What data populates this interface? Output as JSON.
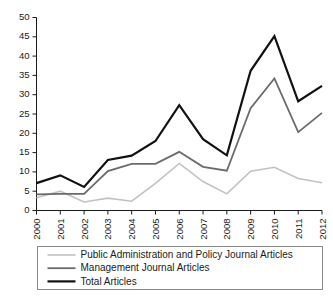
{
  "chart_data": {
    "type": "line",
    "title": "",
    "xlabel": "",
    "ylabel": "",
    "x": [
      "2000",
      "2001",
      "2002",
      "2003",
      "2004",
      "2005",
      "2006",
      "2007",
      "2008",
      "2009",
      "2010",
      "2011",
      "2012"
    ],
    "categories": [
      "2000",
      "2001",
      "2002",
      "2003",
      "2004",
      "2005",
      "2006",
      "2007",
      "2008",
      "2009",
      "2010",
      "2011",
      "2012"
    ],
    "ylim": [
      0,
      50
    ],
    "yticks": [
      0,
      5,
      10,
      15,
      20,
      25,
      30,
      35,
      40,
      45,
      50
    ],
    "ytick_labels": [
      "0",
      "5",
      "10",
      "15",
      "20",
      "25",
      "30",
      "35",
      "40",
      "45",
      "50"
    ],
    "grid": false,
    "legend_position": "below",
    "series": [
      {
        "name": "Public Administration and Policy Journal Articles",
        "color": "#c2c2c2",
        "width": 1.6,
        "values": [
          3.3,
          5.0,
          2.2,
          3.2,
          2.4,
          7.0,
          12.2,
          7.5,
          4.3,
          10.2,
          11.2,
          8.3,
          7.2
        ]
      },
      {
        "name": "Management Journal Articles",
        "color": "#6b6b6b",
        "width": 1.8,
        "values": [
          4.2,
          4.3,
          4.3,
          10.2,
          12.1,
          12.1,
          15.2,
          11.3,
          10.3,
          26.5,
          34.2,
          20.3,
          25.3
        ]
      },
      {
        "name": "Total Articles",
        "color": "#111111",
        "width": 2.2,
        "values": [
          7.1,
          9.1,
          6.1,
          13.1,
          14.2,
          18.0,
          27.3,
          18.5,
          14.3,
          36.2,
          45.2,
          28.3,
          32.3
        ]
      }
    ]
  },
  "legend": {
    "items": [
      {
        "label": "Public Administration and Policy Journal Articles"
      },
      {
        "label": "Management Journal Articles"
      },
      {
        "label": "Total Articles"
      }
    ]
  },
  "colors": {
    "public_admin": "#c2c2c2",
    "management": "#6b6b6b",
    "total": "#111111",
    "axis": "#1a1a1a",
    "legend_border": "#8a8a8a",
    "background": "#ffffff"
  }
}
